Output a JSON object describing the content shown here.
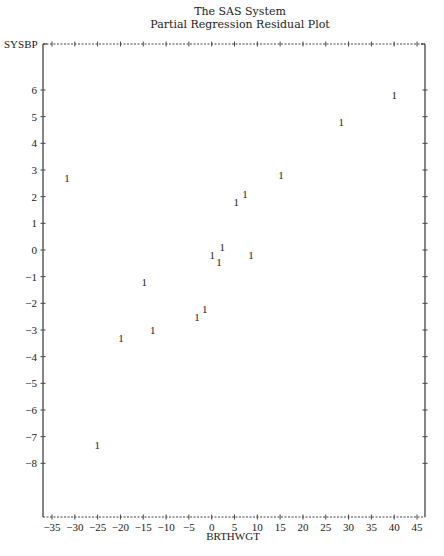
{
  "header": {
    "title": "The SAS System",
    "subtitle": "Partial Regression Residual Plot"
  },
  "chart_data": {
    "type": "scatter",
    "title": "The SAS System",
    "subtitle": "Partial Regression Residual Plot",
    "xlabel": "BRTHWGT",
    "ylabel": "SYSBP",
    "plot_symbol": "1",
    "xlim": [
      -37,
      47
    ],
    "ylim": [
      -11.5,
      9
    ],
    "x_ticks": [
      -35,
      -30,
      -25,
      -20,
      -15,
      -10,
      -5,
      0,
      5,
      10,
      15,
      20,
      25,
      30,
      35,
      40,
      45
    ],
    "y_ticks": [
      6,
      5,
      4,
      3,
      2,
      1,
      0,
      -1,
      -2,
      -3,
      -4,
      -5,
      -6,
      -7,
      -8
    ],
    "grid": false,
    "legend": null,
    "points": [
      {
        "x": -31.7,
        "y": 2.7
      },
      {
        "x": 40.0,
        "y": 5.8
      },
      {
        "x": 28.4,
        "y": 4.8
      },
      {
        "x": 15.2,
        "y": 2.8
      },
      {
        "x": 7.3,
        "y": 2.1
      },
      {
        "x": 5.4,
        "y": 1.8
      },
      {
        "x": 2.3,
        "y": 0.1
      },
      {
        "x": 0.1,
        "y": -0.2
      },
      {
        "x": 1.6,
        "y": -0.45
      },
      {
        "x": 8.6,
        "y": -0.2
      },
      {
        "x": -14.8,
        "y": -1.2
      },
      {
        "x": -1.5,
        "y": -2.2
      },
      {
        "x": -3.2,
        "y": -2.5
      },
      {
        "x": -12.9,
        "y": -3.0
      },
      {
        "x": -19.9,
        "y": -3.3
      },
      {
        "x": -25.1,
        "y": -7.3
      }
    ]
  },
  "colors": {
    "axis": "#444444",
    "text": "#222222",
    "background": "#ffffff"
  }
}
